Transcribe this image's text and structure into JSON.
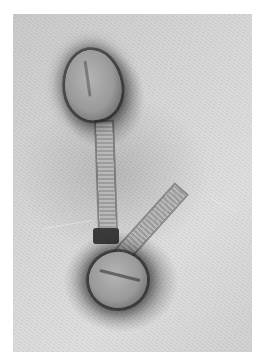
{
  "image": {
    "description": "Transmission electron micrograph of two bacteriophages with icosahedral heads and contractile tails, negatively stained",
    "subjects": [
      {
        "name": "phage-upper",
        "parts": [
          "head",
          "tail",
          "baseplate-collar"
        ]
      },
      {
        "name": "phage-lower",
        "parts": [
          "head",
          "tail"
        ]
      }
    ],
    "colors": {
      "background": "#ffffff",
      "stain_light": "#dedede",
      "stain_dark": "#2a2a2a",
      "capsid": "#a0a0a0"
    }
  }
}
